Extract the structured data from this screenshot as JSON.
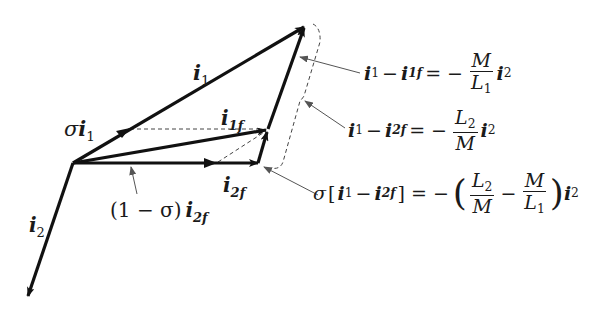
{
  "diagram": {
    "type": "phasor-vector-diagram",
    "colors": {
      "stroke": "#111111",
      "dashed": "#444444",
      "leader": "#555555",
      "background": "#ffffff"
    },
    "origin": [
      73,
      163
    ],
    "vectors": [
      {
        "id": "i1",
        "from": [
          73,
          163
        ],
        "to": [
          305,
          26
        ],
        "label": "i",
        "label_sub": "1"
      },
      {
        "id": "i1f",
        "from": [
          73,
          163
        ],
        "to": [
          268,
          129
        ],
        "label": "i",
        "label_sub": "1f"
      },
      {
        "id": "i2f_part",
        "from": [
          73,
          163
        ],
        "to": [
          216,
          163
        ]
      },
      {
        "id": "i2f",
        "from": [
          216,
          163
        ],
        "to": [
          258,
          163
        ],
        "label": "i",
        "label_sub": "2f"
      },
      {
        "id": "sigma_seg",
        "from": [
          258,
          163
        ],
        "to": [
          268,
          129
        ]
      },
      {
        "id": "i1_minus_i1f",
        "from": [
          268,
          129
        ],
        "to": [
          305,
          26
        ]
      },
      {
        "id": "i2",
        "from": [
          73,
          163
        ],
        "to": [
          27,
          298
        ],
        "label": "i",
        "label_sub": "2"
      }
    ]
  },
  "labels": {
    "i1": {
      "base": "i",
      "sub": "1"
    },
    "sigma_i1": {
      "prefix": "σ",
      "base": "i",
      "sub": "1"
    },
    "i1f": {
      "base": "i",
      "sub": "1f"
    },
    "i2f": {
      "base": "i",
      "sub": "2f"
    },
    "i2": {
      "base": "i",
      "sub": "2"
    },
    "one_minus_sigma_i2f": {
      "prefix": "(1 − σ)",
      "base": "i",
      "sub": "2f"
    }
  },
  "equations": {
    "eq1": {
      "lhs_a": "i",
      "lhs_a_sub": "1",
      "minus": "−",
      "lhs_b": "i",
      "lhs_b_sub": "1f",
      "equals": "= −",
      "num": "M",
      "den": "L",
      "den_sub": "1",
      "rhs": "i",
      "rhs_sub": "2"
    },
    "eq2": {
      "lhs_a": "i",
      "lhs_a_sub": "1",
      "minus": "−",
      "lhs_b": "i",
      "lhs_b_sub": "2f",
      "equals": "= −",
      "num": "L",
      "num_sub": "2",
      "den": "M",
      "rhs": "i",
      "rhs_sub": "2"
    },
    "eq3": {
      "sigma": "σ",
      "open_bracket": "[",
      "lhs_a": "i",
      "lhs_a_sub": "1",
      "minus": "−",
      "lhs_b": "i",
      "lhs_b_sub": "2f",
      "close_bracket": "]",
      "equals": "= −",
      "open_paren": "(",
      "frac1_num": "L",
      "frac1_num_sub": "2",
      "frac1_den": "M",
      "mid_minus": "−",
      "frac2_num": "M",
      "frac2_den": "L",
      "frac2_den_sub": "1",
      "close_paren": ")",
      "rhs": "i",
      "rhs_sub": "2"
    }
  }
}
